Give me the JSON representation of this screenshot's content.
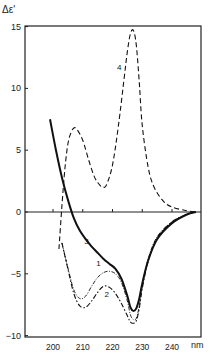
{
  "chart_data": {
    "type": "line",
    "title": "",
    "xlabel": "nm",
    "ylabel": "Δε'",
    "xlim": [
      193,
      250
    ],
    "ylim": [
      -10,
      15
    ],
    "x_ticks": [
      200,
      210,
      220,
      230,
      240
    ],
    "y_ticks": [
      -10,
      -5,
      0,
      5,
      10,
      15
    ],
    "grid": false,
    "legend": "curve numbers labeled inline",
    "series": [
      {
        "name": "1",
        "style": "dash-dot thin",
        "x": [
          203,
          205,
          207,
          209,
          211,
          213,
          215,
          217,
          219,
          221,
          223,
          225,
          226,
          227,
          228,
          229,
          230,
          232,
          235,
          240,
          245,
          248
        ],
        "y": [
          -2.5,
          -4.5,
          -6.3,
          -7.0,
          -6.8,
          -6.0,
          -5.3,
          -4.9,
          -4.8,
          -5.0,
          -5.7,
          -7.2,
          -8.3,
          -8.7,
          -8.6,
          -7.6,
          -6.0,
          -3.8,
          -2.0,
          -0.8,
          -0.2,
          0
        ]
      },
      {
        "name": "2",
        "style": "dash-dot",
        "x": [
          203,
          205,
          207,
          209,
          211,
          213,
          215,
          217,
          219,
          221,
          223,
          225,
          226,
          227,
          228,
          229,
          230,
          232,
          235,
          240,
          245,
          248
        ],
        "y": [
          -2.5,
          -4.6,
          -6.6,
          -7.6,
          -7.7,
          -7.2,
          -6.5,
          -6.0,
          -6.1,
          -6.6,
          -7.4,
          -8.4,
          -8.9,
          -9.0,
          -8.8,
          -7.8,
          -6.2,
          -4.0,
          -2.1,
          -0.8,
          -0.2,
          0
        ]
      },
      {
        "name": "3",
        "style": "solid thick",
        "x": [
          199,
          201,
          203,
          205,
          207,
          209,
          211,
          213,
          215,
          217,
          219,
          221,
          223,
          225,
          226,
          227,
          228,
          229,
          230,
          232,
          235,
          240,
          245,
          248
        ],
        "y": [
          7.5,
          5.0,
          2.8,
          1.0,
          -0.5,
          -1.5,
          -2.2,
          -2.8,
          -3.3,
          -3.8,
          -4.2,
          -4.6,
          -5.4,
          -6.8,
          -7.7,
          -8.0,
          -7.8,
          -7.0,
          -5.8,
          -3.9,
          -2.2,
          -0.9,
          -0.2,
          0
        ]
      },
      {
        "name": "4",
        "style": "dashed",
        "x": [
          202,
          203,
          204,
          205,
          206,
          207,
          208,
          210,
          212,
          214,
          216,
          217,
          218,
          220,
          222,
          224,
          225,
          226,
          227,
          228,
          229,
          230,
          232,
          234,
          237,
          240,
          245,
          248
        ],
        "y": [
          -3.0,
          0.5,
          3.5,
          5.5,
          6.4,
          6.8,
          6.7,
          5.8,
          4.2,
          2.8,
          2.1,
          2.0,
          2.2,
          3.8,
          7.0,
          11.0,
          13.0,
          14.4,
          14.7,
          13.5,
          10.5,
          7.0,
          3.6,
          2.0,
          0.9,
          0.4,
          0.1,
          0
        ]
      }
    ],
    "annotations": [
      {
        "text": "1",
        "x": 214.5,
        "y": -4.4
      },
      {
        "text": "2",
        "x": 217.3,
        "y": -6.9
      },
      {
        "text": "3",
        "x": 210.5,
        "y": -2.6
      },
      {
        "text": "4",
        "x": 221.5,
        "y": 11.5
      }
    ]
  },
  "axes": {
    "y_label": "Δε'",
    "x_unit": "nm",
    "y_tick_labels": [
      "15",
      "10",
      "5",
      "0",
      "−5",
      "−10"
    ],
    "x_tick_labels": [
      "200",
      "210",
      "220",
      "230",
      "240"
    ]
  }
}
